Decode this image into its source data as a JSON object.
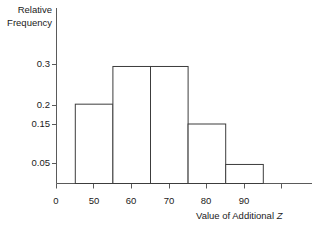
{
  "chart_data": {
    "type": "bar",
    "title": "",
    "subtitle": "",
    "xlabel": "Value of Additional Z",
    "ylabel": "Relative Frequency",
    "ylabel_lines": [
      "Relative",
      "Frequency"
    ],
    "grid": false,
    "legend": null,
    "bin_edges": [
      45,
      55,
      65,
      75,
      85,
      95
    ],
    "categories": [
      "45-55",
      "55-65",
      "65-75",
      "75-85",
      "85-95"
    ],
    "values": [
      0.2,
      0.295,
      0.295,
      0.15,
      0.048
    ],
    "xlim": [
      40,
      100
    ],
    "ylim": [
      0,
      0.33
    ],
    "xticks": [
      40,
      50,
      60,
      70,
      80,
      90
    ],
    "xtick_labels": [
      "0",
      "50",
      "60",
      "70",
      "80",
      "90"
    ],
    "yticks": [
      0.3,
      0.2,
      0.15,
      0.05
    ],
    "ytick_labels": [
      "0.3",
      "0.2",
      "0.15",
      "0.05"
    ],
    "bar_fill": "#ffffff",
    "bar_stroke": "#3c3c3c",
    "axis_color": "#5a5a5a"
  },
  "axes": {
    "y_title_line1": "Relative",
    "y_title_line2": "Frequency",
    "x_title_prefix": "Value of Additional ",
    "x_title_variable": "Z"
  },
  "ytick_0": "0.3",
  "ytick_1": "0.2",
  "ytick_2": "0.15",
  "ytick_3": "0.05",
  "xtick_0": "0",
  "xtick_1": "50",
  "xtick_2": "60",
  "xtick_3": "70",
  "xtick_4": "80",
  "xtick_5": "90"
}
